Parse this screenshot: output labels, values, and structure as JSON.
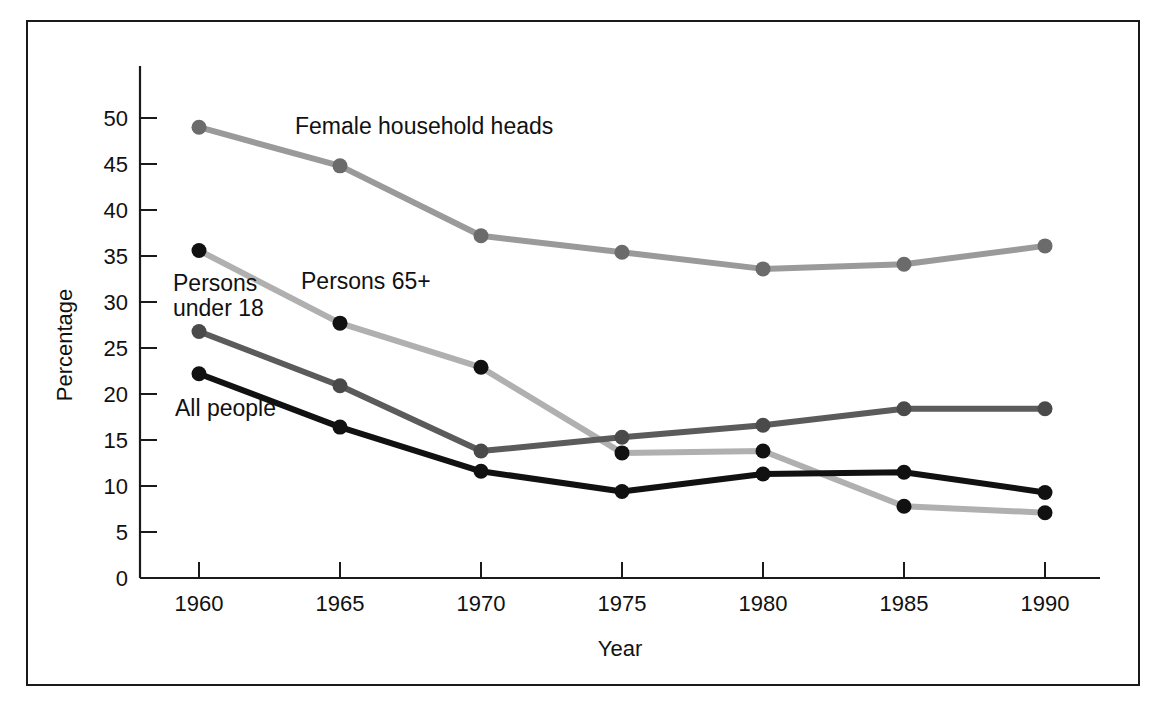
{
  "chart_data": {
    "type": "line",
    "title": "",
    "subtitle": "",
    "xlabel": "Year",
    "ylabel": "Percentage",
    "x": [
      1960,
      1965,
      1970,
      1975,
      1980,
      1985,
      1990
    ],
    "xticklabels": [
      "1960",
      "1965",
      "1970",
      "1975",
      "1980",
      "1985",
      "1990"
    ],
    "yticklabels": [
      "0",
      "5",
      "10",
      "15",
      "20",
      "25",
      "30",
      "35",
      "40",
      "45",
      "50"
    ],
    "yticks": [
      0,
      5,
      10,
      15,
      20,
      25,
      30,
      35,
      40,
      45,
      50
    ],
    "xlim": [
      1957.5,
      1991.5
    ],
    "ylim": [
      0,
      52
    ],
    "grid": false,
    "legend_position": "inline-annotations",
    "markers": "filled-circle",
    "series": [
      {
        "name": "Female household heads",
        "label": "Female household heads",
        "color": "#9a9a9a",
        "marker_color": "#6b6b6b",
        "values": [
          49.0,
          44.8,
          37.2,
          35.4,
          33.6,
          34.1,
          36.1
        ]
      },
      {
        "name": "Persons 65+",
        "label": "Persons 65+",
        "color": "#b0b0b0",
        "marker_color": "#111111",
        "values": [
          35.6,
          27.7,
          22.9,
          13.6,
          13.8,
          7.8,
          7.1
        ]
      },
      {
        "name": "Persons under 18",
        "label": "Persons under 18",
        "color": "#5b5b5b",
        "marker_color": "#4a4a4a",
        "values": [
          26.8,
          20.9,
          13.8,
          15.3,
          16.6,
          18.4,
          18.4
        ]
      },
      {
        "name": "All people",
        "label": "All people",
        "color": "#111111",
        "marker_color": "#111111",
        "values": [
          22.2,
          16.4,
          11.6,
          9.4,
          11.3,
          11.5,
          9.3
        ]
      }
    ],
    "annotations": [
      {
        "text": "Female household heads",
        "x_px": 295,
        "y_px": 134,
        "anchor": "start"
      },
      {
        "text": "Persons 65+",
        "x_px": 301,
        "y_px": 289,
        "anchor": "start"
      },
      {
        "text": "Persons",
        "x_px": 173,
        "y_px": 291,
        "anchor": "start"
      },
      {
        "text": "under 18",
        "x_px": 173,
        "y_px": 316,
        "anchor": "start"
      },
      {
        "text": "All people",
        "x_px": 175,
        "y_px": 416,
        "anchor": "start"
      }
    ]
  },
  "axes": {
    "y_title": "Percentage",
    "x_title": "Year"
  }
}
